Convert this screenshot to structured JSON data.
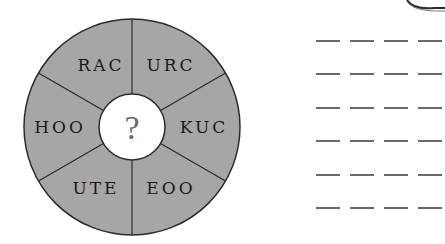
{
  "puzzle": {
    "center_symbol": "?",
    "segments": [
      {
        "label": "RAC"
      },
      {
        "label": "URC"
      },
      {
        "label": "KUC"
      },
      {
        "label": "EOO"
      },
      {
        "label": "UTE"
      },
      {
        "label": "HOO"
      }
    ],
    "colors": {
      "segment_fill": "#a6a6a6",
      "outline": "#2b2b2b",
      "center_fill": "#ffffff",
      "dash": "#6a6a6a"
    }
  },
  "answer_area": {
    "rows": 6,
    "dashes_per_row": 4
  }
}
